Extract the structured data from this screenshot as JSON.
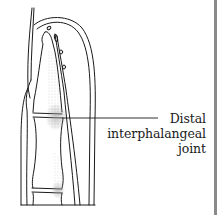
{
  "figure": {
    "label": {
      "line1": "Distal",
      "line2": "interphalangeal",
      "line3": "joint"
    },
    "colors": {
      "line": "#1a1a1a",
      "stipple": "#9a9a9a",
      "border": "#8a8a8a",
      "background": "#ffffff"
    }
  }
}
